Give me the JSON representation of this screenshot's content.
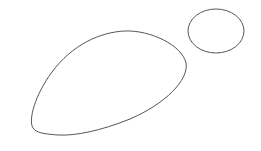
{
  "canvas": {
    "width": 261,
    "height": 151,
    "background": "#ffffff"
  },
  "shapes": [
    {
      "name": "large-blob",
      "type": "path",
      "d": "M 33 128 C 28 120, 35 95, 52 72 C 72 45, 100 32, 125 31 C 150 30, 182 45, 186 63 C 189 80, 165 104, 130 119 C 100 131, 75 136, 58 135 C 45 134, 36 133, 33 128 Z",
      "stroke": "#555555",
      "stroke_width": 1,
      "fill": "none"
    },
    {
      "name": "small-ellipse",
      "type": "ellipse",
      "cx": 216,
      "cy": 31,
      "rx": 28,
      "ry": 22,
      "stroke": "#555555",
      "stroke_width": 1,
      "fill": "none"
    }
  ]
}
